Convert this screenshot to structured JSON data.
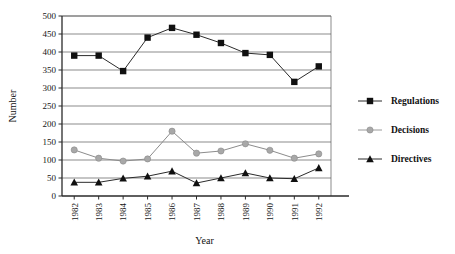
{
  "chart_data": {
    "type": "line",
    "title": "",
    "xlabel": "Year",
    "ylabel": "Number",
    "categories": [
      "1982",
      "1983",
      "1984",
      "1985",
      "1986",
      "1987",
      "1988",
      "1989",
      "1990",
      "1991",
      "1992"
    ],
    "ylim": [
      0,
      500
    ],
    "ytick_step": 50,
    "yticks": [
      "0",
      "50",
      "100",
      "150",
      "200",
      "250",
      "300",
      "350",
      "400",
      "450",
      "500"
    ],
    "grid": "horizontal",
    "legend_position": "right",
    "series": [
      {
        "name": "Regulations",
        "marker": "square",
        "color": "#101010",
        "values": [
          390,
          390,
          347,
          440,
          467,
          448,
          425,
          397,
          392,
          317,
          360
        ]
      },
      {
        "name": "Decisions",
        "marker": "circle",
        "color": "#a8a8a8",
        "values": [
          128,
          105,
          97,
          103,
          180,
          119,
          125,
          145,
          127,
          105,
          117
        ]
      },
      {
        "name": "Directives",
        "marker": "triangle",
        "color": "#101010",
        "values": [
          38,
          38,
          49,
          55,
          69,
          36,
          50,
          64,
          50,
          48,
          78
        ]
      }
    ]
  }
}
